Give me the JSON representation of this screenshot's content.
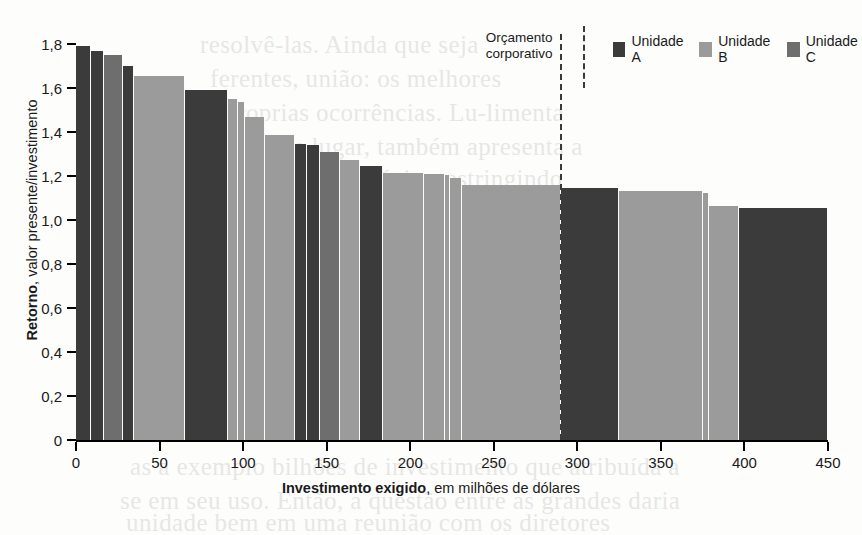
{
  "chart_data": {
    "type": "bar",
    "title": "",
    "xlabel_bold": "Investimento exigido",
    "xlabel_rest": ", em milhões de dólares",
    "ylabel_bold": "Retorno",
    "ylabel_rest": ", valor presente/investimento",
    "xlim": [
      0,
      450
    ],
    "ylim": [
      0,
      1.8
    ],
    "xticks": [
      0,
      50,
      100,
      150,
      200,
      250,
      300,
      350,
      400,
      450
    ],
    "xtick_labels": [
      "0",
      "50",
      "100",
      "150",
      "200",
      "250",
      "300",
      "350",
      "400",
      "450"
    ],
    "yticks": [
      0,
      0.2,
      0.4,
      0.6,
      0.8,
      1.0,
      1.2,
      1.4,
      1.6,
      1.8
    ],
    "ytick_labels": [
      "0",
      "0,2",
      "0,4",
      "0,6",
      "0,8",
      "1,0",
      "1,2",
      "1,4",
      "1,6",
      "1,8"
    ],
    "grid": false,
    "orientation": "variable-width-bars",
    "x_is_cumulative_width": true,
    "annotations": [
      {
        "name": "budget-line",
        "line1": "Orçamento",
        "line2": "corporativo",
        "x_value": 290,
        "style": "dashed-vertical"
      }
    ],
    "legend": {
      "position": "top-right",
      "entries": [
        {
          "label": "Unidade A",
          "color": "#3b3b3b"
        },
        {
          "label": "Unidade B",
          "color": "#9b9b9b"
        },
        {
          "label": "Unidade C",
          "color": "#6e6e6e"
        }
      ]
    },
    "series_colors": {
      "Unidade A": "#3b3b3b",
      "Unidade B": "#9b9b9b",
      "Unidade C": "#6e6e6e"
    },
    "bars": [
      {
        "unit": "Unidade A",
        "x_start": 0,
        "width": 9,
        "value": 1.79
      },
      {
        "unit": "Unidade A",
        "x_start": 9,
        "width": 8,
        "value": 1.77
      },
      {
        "unit": "Unidade C",
        "x_start": 17,
        "width": 11,
        "value": 1.75
      },
      {
        "unit": "Unidade A",
        "x_start": 28,
        "width": 7,
        "value": 1.7
      },
      {
        "unit": "Unidade B",
        "x_start": 35,
        "width": 30,
        "value": 1.655
      },
      {
        "unit": "Unidade A",
        "x_start": 65,
        "width": 26,
        "value": 1.59
      },
      {
        "unit": "Unidade B",
        "x_start": 91,
        "width": 6,
        "value": 1.55
      },
      {
        "unit": "Unidade B",
        "x_start": 97,
        "width": 4,
        "value": 1.535
      },
      {
        "unit": "Unidade B",
        "x_start": 101,
        "width": 12,
        "value": 1.47
      },
      {
        "unit": "Unidade B",
        "x_start": 113,
        "width": 18,
        "value": 1.385
      },
      {
        "unit": "Unidade A",
        "x_start": 131,
        "width": 7,
        "value": 1.345
      },
      {
        "unit": "Unidade A",
        "x_start": 138,
        "width": 8,
        "value": 1.34
      },
      {
        "unit": "Unidade C",
        "x_start": 146,
        "width": 12,
        "value": 1.31
      },
      {
        "unit": "Unidade B",
        "x_start": 158,
        "width": 12,
        "value": 1.275
      },
      {
        "unit": "Unidade A",
        "x_start": 170,
        "width": 14,
        "value": 1.245
      },
      {
        "unit": "Unidade B",
        "x_start": 184,
        "width": 24,
        "value": 1.215
      },
      {
        "unit": "Unidade B",
        "x_start": 208,
        "width": 13,
        "value": 1.21
      },
      {
        "unit": "Unidade B",
        "x_start": 221,
        "width": 3,
        "value": 1.205
      },
      {
        "unit": "Unidade B",
        "x_start": 224,
        "width": 7,
        "value": 1.19
      },
      {
        "unit": "Unidade B",
        "x_start": 231,
        "width": 59,
        "value": 1.16
      },
      {
        "unit": "Unidade A",
        "x_start": 290,
        "width": 35,
        "value": 1.145
      },
      {
        "unit": "Unidade B",
        "x_start": 325,
        "width": 50,
        "value": 1.13
      },
      {
        "unit": "Unidade B",
        "x_start": 375,
        "width": 4,
        "value": 1.125
      },
      {
        "unit": "Unidade B",
        "x_start": 379,
        "width": 18,
        "value": 1.065
      },
      {
        "unit": "Unidade A",
        "x_start": 397,
        "width": 53,
        "value": 1.055
      }
    ]
  },
  "bleed_text": [
    {
      "text": "resolvê-las. Ainda que seja",
      "x": 200,
      "y": 28
    },
    {
      "text": "ferentes, união: os melhores",
      "x": 210,
      "y": 62
    },
    {
      "text": "se proprias ocorrências. Lu-limenta",
      "x": 196,
      "y": 96
    },
    {
      "text": "Torno um lugar, também apresenta a",
      "x": 204,
      "y": 130
    },
    {
      "text": "unidades de negócio, restringindo",
      "x": 212,
      "y": 162
    },
    {
      "text": "os",
      "x": 780,
      "y": 300
    },
    {
      "text": "as a exemplo bilhões de investimento que atribuída a",
      "x": 130,
      "y": 450
    },
    {
      "text": "se em seu uso. Então, a questão entre as grandes daria",
      "x": 120,
      "y": 484
    },
    {
      "text": "unidade bem em uma reunião com os diretores",
      "x": 126,
      "y": 506
    }
  ]
}
